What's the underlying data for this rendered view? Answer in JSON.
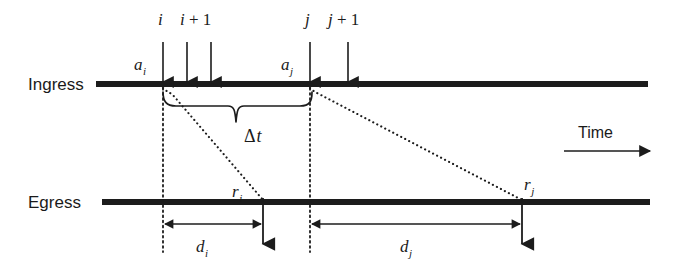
{
  "figure": {
    "width": 674,
    "height": 268,
    "background_color": "#ffffff",
    "ink_color": "#1c1c1c"
  },
  "axes": {
    "ingress": {
      "label": "Ingress",
      "y": 84,
      "x_start": 96,
      "x_end": 648
    },
    "egress": {
      "label": "Egress",
      "y": 202,
      "x_start": 102,
      "x_end": 650
    },
    "time": {
      "label": "Time",
      "arrow_x_start": 564,
      "arrow_x_end": 652,
      "arrow_y": 150,
      "label_x": 578,
      "label_y": 136
    }
  },
  "arrivals": [
    {
      "id": "i",
      "label": "i",
      "label_suffix": "",
      "x": 163,
      "has_top_label": true,
      "arrival_marker": "a_i"
    },
    {
      "id": "i_plus",
      "label": "i",
      "label_suffix": " + 1",
      "x": 187,
      "has_top_label": true,
      "arrival_marker": ""
    },
    {
      "id": "i_next",
      "label": "",
      "label_suffix": "",
      "x": 211,
      "has_top_label": false,
      "arrival_marker": ""
    },
    {
      "id": "j",
      "label": "j",
      "label_suffix": "",
      "x": 310,
      "has_top_label": true,
      "arrival_marker": "a_j"
    },
    {
      "id": "j_plus",
      "label": "j",
      "label_suffix": " + 1",
      "x": 348,
      "has_top_label": true,
      "arrival_marker": ""
    }
  ],
  "arrival_labels": [
    {
      "name": "a_i",
      "base": "a",
      "sub": "i",
      "x": 134,
      "y": 70
    },
    {
      "name": "a_j",
      "base": "a",
      "sub": "j",
      "x": 281,
      "y": 70
    }
  ],
  "departures": [
    {
      "id": "r_i",
      "base": "r",
      "sub": "i",
      "x": 263,
      "label_x": 232,
      "label_y": 197
    },
    {
      "id": "r_j",
      "base": "r",
      "sub": "j",
      "x": 522,
      "label_x": 524,
      "label_y": 190
    }
  ],
  "service_paths": [
    {
      "id": "path_i",
      "from_x": 163,
      "from_y": 90,
      "to_x": 263,
      "to_y": 200
    },
    {
      "id": "path_j",
      "from_x": 310,
      "from_y": 90,
      "to_x": 522,
      "to_y": 200
    }
  ],
  "delta": {
    "label_base": "Δ",
    "label_var": "t",
    "brace_left_x": 163,
    "brace_right_x": 312,
    "brace_top_y": 94,
    "brace_tip_y": 122,
    "label_x": 244,
    "label_y": 140
  },
  "delays": [
    {
      "id": "d_i",
      "base": "d",
      "sub": "i",
      "from_x": 163,
      "to_x": 263,
      "y": 224,
      "label_x": 203,
      "label_y": 247
    },
    {
      "id": "d_j",
      "base": "d",
      "sub": "j",
      "from_x": 310,
      "to_x": 522,
      "y": 224,
      "label_x": 407,
      "label_y": 247
    }
  ],
  "guide_lines": [
    {
      "id": "guide_i",
      "x": 163,
      "y_start": 88,
      "y_end": 252
    },
    {
      "id": "guide_j",
      "x": 310,
      "y_start": 88,
      "y_end": 252
    }
  ]
}
